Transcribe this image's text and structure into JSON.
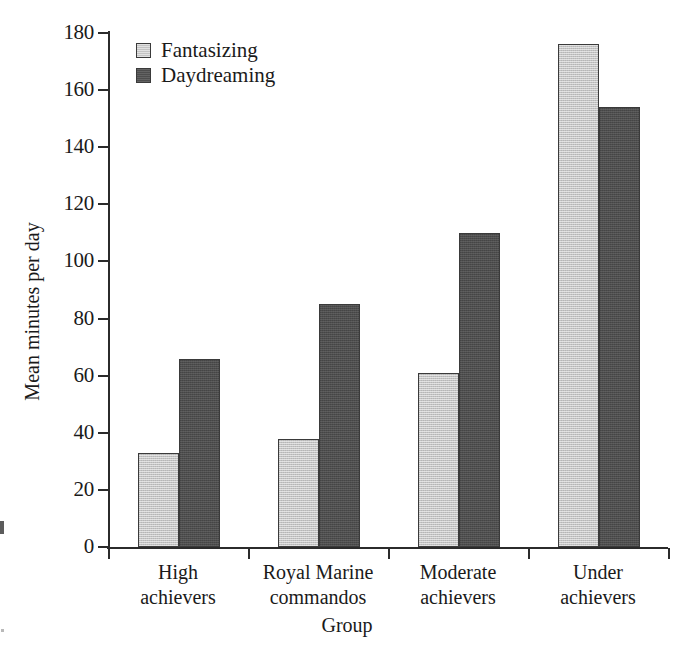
{
  "chart_data": {
    "type": "bar",
    "title": "",
    "xlabel": "Group",
    "ylabel": "Mean minutes per day",
    "categories": [
      "High achievers",
      "Royal Marine commandos",
      "Moderate achievers",
      "Under achievers"
    ],
    "category_lines": [
      [
        "High",
        "achievers"
      ],
      [
        "Royal Marine",
        "commandos"
      ],
      [
        "Moderate",
        "achievers"
      ],
      [
        "Under",
        "achievers"
      ]
    ],
    "series": [
      {
        "name": "Fantasizing",
        "color": "#c3c3c3",
        "values": [
          33,
          38,
          61,
          176
        ]
      },
      {
        "name": "Daydreaming",
        "color": "#4d4d4d",
        "values": [
          66,
          85,
          110,
          154
        ]
      }
    ],
    "ylim": [
      0,
      180
    ],
    "ytick_values": [
      0,
      20,
      40,
      60,
      80,
      100,
      120,
      140,
      160,
      180
    ],
    "ytick_labels": [
      "0",
      "20",
      "40",
      "60",
      "80",
      "100",
      "120",
      "140",
      "160",
      "180"
    ],
    "grid": false,
    "legend_position": "top-left"
  },
  "legend": {
    "entries": [
      {
        "label": "Fantasizing"
      },
      {
        "label": "Daydreaming"
      }
    ]
  }
}
